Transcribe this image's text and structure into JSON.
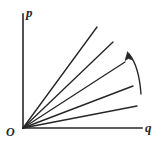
{
  "figure": {
    "background_color": "#ffffff",
    "ink_color": "#262626",
    "labels": {
      "y_axis": "p",
      "x_axis": "q",
      "origin": "O"
    }
  },
  "chart_data": {
    "type": "line",
    "title": "",
    "xlabel": "q",
    "ylabel": "p",
    "grid": false,
    "legend": null,
    "xlim": [
      0,
      160
    ],
    "ylim": [
      0,
      148
    ],
    "origin_pixel": [
      23,
      128
    ],
    "axes": {
      "y_axis": {
        "x": 23,
        "y_top": 14,
        "y_bottom": 128,
        "arrow": false
      },
      "x_axis": {
        "y": 128,
        "x_left": 23,
        "x_right": 142,
        "arrow": false
      }
    },
    "series": [
      {
        "name": "ray-1",
        "slope_label": "steepest",
        "x": [
          23,
          97
        ],
        "y": [
          128,
          27
        ]
      },
      {
        "name": "ray-2",
        "slope_label": "steep",
        "x": [
          23,
          113
        ],
        "y": [
          128,
          42
        ]
      },
      {
        "name": "ray-3",
        "slope_label": "medium",
        "x": [
          23,
          125
        ],
        "y": [
          128,
          62
        ]
      },
      {
        "name": "ray-4",
        "slope_label": "shallow",
        "x": [
          23,
          133
        ],
        "y": [
          128,
          86
        ]
      },
      {
        "name": "ray-5",
        "slope_label": "shallowest",
        "x": [
          23,
          137
        ],
        "y": [
          128,
          106
        ]
      }
    ],
    "annotations": [
      {
        "name": "rotation-arrow",
        "type": "curved_arrow",
        "direction": "counter-clockwise",
        "path": "M 141 94 Q 139 66 129 54",
        "arrow_tip": [
          128,
          53
        ],
        "text": ""
      }
    ]
  }
}
